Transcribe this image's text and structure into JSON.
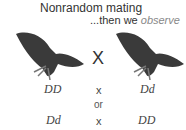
{
  "title": "Nonrandom mating",
  "subtitle_prefix": "...then we ",
  "subtitle_emph": "observe",
  "cross_symbol": "X",
  "rows": [
    {
      "left": "DD",
      "op": "x",
      "right": "Dd"
    },
    {
      "left": "Dd",
      "op": "x",
      "right": "DD"
    }
  ],
  "or_label": "or",
  "icons": [
    "moth-icon",
    "moth-icon"
  ]
}
